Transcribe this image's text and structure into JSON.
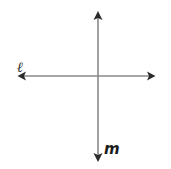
{
  "figure": {
    "background_color": "#ffffff",
    "line_color": "#8a8a8a",
    "arrowhead_color": "#2b2b2b",
    "label_color": "#1a1a1a",
    "labels": {
      "horizontal_line": "ℓ",
      "vertical_line": "m"
    },
    "geometry": {
      "intersection_x": 98,
      "intersection_y": 76,
      "horizontal_line": {
        "x_start": 18,
        "x_end": 155,
        "y": 76,
        "arrow_left": true,
        "arrow_right": true
      },
      "vertical_line": {
        "y_start": 12,
        "y_end": 161,
        "x": 98,
        "arrow_top": true,
        "arrow_bottom": true
      }
    }
  }
}
